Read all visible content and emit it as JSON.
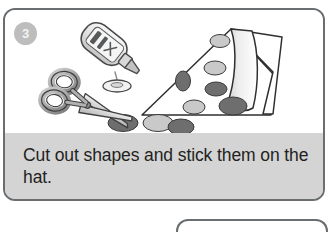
{
  "page": {
    "background_color": "#ffffff",
    "width": 332,
    "height": 232
  },
  "card": {
    "step_number": "3",
    "border_color": "#6a6e70",
    "caption_band_color": "#d4d4d4",
    "caption": "Cut out shapes and stick them on the hat.",
    "badge_color": "#bdbdbd",
    "badge_text_color": "#f2f2f2"
  },
  "illustration": {
    "name": "craft-materials-illustration",
    "description": "Glue bottle dripping glue, scissors, a triangular paper hat with oval spots, and loose cut-out oval shapes",
    "objects": [
      {
        "name": "glue-bottle",
        "label_color": "#58595b"
      },
      {
        "name": "glue-drop",
        "color": "#e8e8e8"
      },
      {
        "name": "scissors",
        "color": "#9a9a9a"
      },
      {
        "name": "paper-hat",
        "color": "#ffffff"
      },
      {
        "name": "oval-shapes-light",
        "color": "#c9c9c9"
      },
      {
        "name": "oval-shapes-dark",
        "color": "#6e6e6e"
      }
    ]
  },
  "next_card": {
    "name": "next-step-card",
    "visible_portion": "top-edge-only"
  }
}
